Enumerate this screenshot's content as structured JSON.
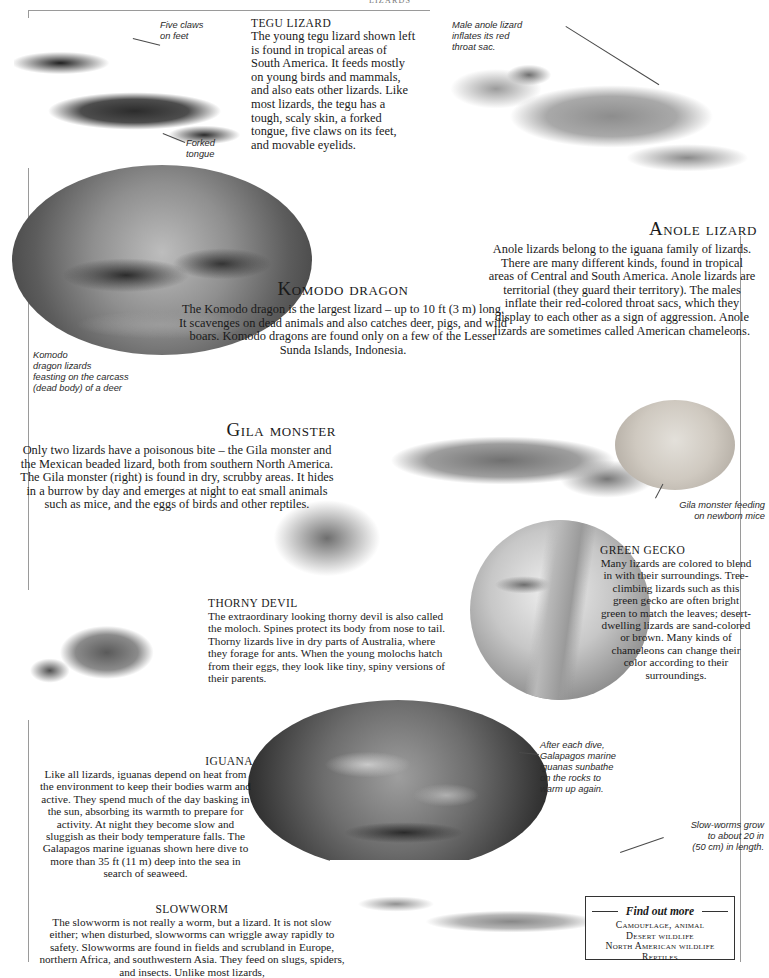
{
  "page": {
    "running_head": "LIZARDS"
  },
  "images": {
    "tegu": "tegu-lizard-photo",
    "anole": "anole-lizard-photo",
    "komodo": "komodo-dragons-feeding-photo",
    "gila": "gila-monster-photo",
    "mice": "gila-monster-feeding-on-mice-photo",
    "gecko": "green-gecko-photo",
    "thorny": "thorny-devil-photo",
    "galapagos": "galapagos-marine-iguanas-photo",
    "slowworm": "slowworm-photo"
  },
  "sections": {
    "tegu": {
      "heading": "TEGU LIZARD",
      "body": "The young tegu lizard shown left is found in tropical areas of South America. It feeds mostly on young birds and mammals, and also eats other lizards. Like most lizards, the tegu has a tough, scaly skin, a forked tongue, five claws on its feet, and movable eyelids."
    },
    "anole": {
      "heading": "Anole lizard",
      "body": "Anole lizards belong to the iguana family of lizards. There are many different kinds, found in tropical areas of Central and South America. Anole lizards are territorial (they guard their territory). The males inflate their red-colored throat sacs, which they display to each other as a sign of aggression. Anole lizards are sometimes called American chameleons."
    },
    "komodo": {
      "heading": "Komodo dragon",
      "body": "The Komodo dragon is the largest lizard – up to 10 ft (3 m) long. It scavenges on dead animals and also catches deer, pigs, and wild boars. Komodo dragons are found only on a few of the Lesser Sunda Islands, Indonesia."
    },
    "gila": {
      "heading": "Gila monster",
      "body": "Only two lizards have a poisonous bite – the Gila monster and the Mexican beaded lizard, both from southern North America. The Gila monster (right) is found in dry, scrubby areas. It hides in a burrow by day and emerges at night to eat small animals such as mice, and the eggs of birds and other reptiles."
    },
    "thorny": {
      "heading": "THORNY DEVIL",
      "body": "The extraordinary looking thorny devil is also called the moloch. Spines protect its body from nose to tail. Thorny lizards live in dry parts of Australia, where they forage for ants. When the young molochs hatch from their eggs, they look like tiny, spiny versions of their parents."
    },
    "gecko": {
      "heading": "GREEN GECKO",
      "body": "Many lizards are colored to blend in with their surroundings. Tree-climbing lizards such as this green gecko are often bright green to match the leaves; desert-dwelling lizards are sand-colored or brown. Many kinds of chameleons can change their color according to their surroundings."
    },
    "iguana": {
      "heading": "IGUANA",
      "body": "Like all lizards, iguanas depend on heat from the environment to keep their bodies warm and active. They spend much of the day basking in the sun, absorbing its warmth to prepare for activity. At night they become slow and sluggish as their body temperature falls. The Galapagos marine iguanas shown here dive to more than 35 ft (11 m) deep into the sea in search of seaweed."
    },
    "slowworm": {
      "heading": "SLOWWORM",
      "body": "The slowworm is not really a worm, but a lizard. It is not slow either; when disturbed, slowworms can wriggle away rapidly to safety. Slowworms are found in fields and scrubland in Europe, northern Africa, and southwestern Asia. They feed on slugs, spiders, and insects. Unlike most lizards,"
    }
  },
  "annotations": {
    "five_claws": "Five claws\non feet",
    "forked_tongue": "Forked\ntongue",
    "male_anole": "Male anole lizard\ninflates its red\nthroat sac.",
    "komodo_caption": "Komodo\ndragon lizards\nfeasting on the carcass\n(dead body) of a deer",
    "gila_mice": "Gila monster feeding\non newborn mice",
    "galapagos": "After each dive,\nGalapagos marine\niguanas sunbathe\non the rocks to\nwarm up again.",
    "slowworm_length": "Slow-worms grow\nto about 20 in\n(50 cm) in length."
  },
  "find_out_more": {
    "title": "Find out more",
    "items": [
      "Camouflage, animal",
      "Desert wildlife",
      "North American wildlife",
      "Reptiles"
    ]
  }
}
